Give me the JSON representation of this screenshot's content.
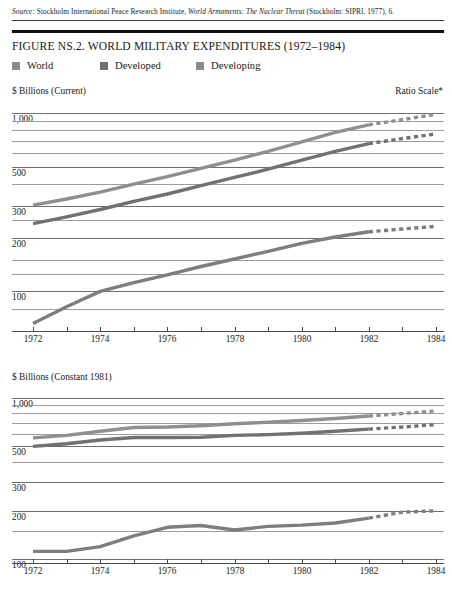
{
  "source": {
    "label": "Source:",
    "body_before": " Stockholm International Peace Research Institute, ",
    "title": "World Armaments: The Nuclear Threat",
    "body_after": " (Stockholm: SIPRI, 1977), 6."
  },
  "figure": {
    "title": "FIGURE NS.2. WORLD MILITARY EXPENDITURES (1972–1984)"
  },
  "legend": {
    "items": [
      {
        "label": "World",
        "color": "#8c8c8c",
        "x": 0
      },
      {
        "label": "Developed",
        "color": "#6e6e6e",
        "x": 88
      },
      {
        "label": "Developing",
        "color": "#8c8c8c",
        "x": 184
      }
    ]
  },
  "colors": {
    "world": "#8f8f8f",
    "developed": "#717171",
    "developing": "#7e7e7e",
    "gridline": "#9d9d9d",
    "axis": "#4a4a4a",
    "rule": "#111111",
    "text": "#1a1a1a"
  },
  "chart_data": [
    {
      "id": "upper",
      "type": "line",
      "title": "",
      "ylabel": "$ Billions (Current)",
      "xlabel": "",
      "annotation": "Ratio Scale*",
      "scale": "log",
      "ylim": [
        60,
        1200
      ],
      "yticks": [
        1000,
        900,
        800,
        700,
        600,
        500,
        400,
        300,
        250,
        200,
        150,
        125,
        100,
        80
      ],
      "ytick_labels": [
        "1,000",
        "",
        "",
        "",
        "",
        "500",
        "",
        "300",
        "",
        "200",
        "",
        "",
        "100",
        ""
      ],
      "grid": true,
      "xlim": [
        1972,
        1984
      ],
      "x": [
        1972,
        1973,
        1974,
        1975,
        1976,
        1977,
        1978,
        1979,
        1980,
        1981,
        1982,
        1983,
        1984
      ],
      "xtick_labels": [
        "1972",
        "",
        "1974",
        "",
        "1976",
        "",
        "1978",
        "",
        "1980",
        "",
        "1982",
        "",
        "1984"
      ],
      "projection_starts": 1982,
      "series": [
        {
          "name": "World",
          "color": "#8f8f8f",
          "values": [
            305,
            330,
            360,
            400,
            440,
            490,
            545,
            610,
            690,
            780,
            860,
            920,
            985
          ]
        },
        {
          "name": "Developed",
          "color": "#717171",
          "values": [
            240,
            262,
            288,
            320,
            352,
            392,
            436,
            485,
            545,
            610,
            675,
            720,
            765
          ]
        },
        {
          "name": "Developing",
          "color": "#7e7e7e",
          "values": [
            66,
            82,
            100,
            112,
            124,
            138,
            152,
            168,
            186,
            202,
            216,
            224,
            232
          ]
        }
      ]
    },
    {
      "id": "lower",
      "type": "line",
      "title": "",
      "ylabel": "$ Billions (Constant 1981)",
      "xlabel": "",
      "annotation": "",
      "scale": "log",
      "ylim": [
        95,
        1200
      ],
      "yticks": [
        1000,
        900,
        800,
        700,
        600,
        500,
        400,
        300,
        200,
        150,
        100
      ],
      "ytick_labels": [
        "1,000",
        "",
        "",
        "",
        "",
        "500",
        "",
        "300",
        "200",
        "",
        "100"
      ],
      "grid": true,
      "xlim": [
        1972,
        1984
      ],
      "x": [
        1972,
        1973,
        1974,
        1975,
        1976,
        1977,
        1978,
        1979,
        1980,
        1981,
        1982,
        1983,
        1984
      ],
      "xtick_labels": [
        "1972",
        "",
        "1974",
        "",
        "1976",
        "",
        "1978",
        "",
        "1980",
        "",
        "1982",
        "",
        "1984"
      ],
      "projection_starts": 1982,
      "series": [
        {
          "name": "World",
          "color": "#8f8f8f",
          "values": [
            565,
            585,
            620,
            655,
            660,
            672,
            690,
            706,
            724,
            745,
            772,
            800,
            830
          ]
        },
        {
          "name": "Developed",
          "color": "#717171",
          "values": [
            500,
            520,
            548,
            568,
            568,
            570,
            585,
            592,
            604,
            620,
            640,
            660,
            682
          ]
        },
        {
          "name": "Developing",
          "color": "#7e7e7e",
          "values": [
            112,
            112,
            120,
            140,
            158,
            162,
            152,
            160,
            163,
            168,
            180,
            196,
            200
          ]
        }
      ]
    }
  ]
}
